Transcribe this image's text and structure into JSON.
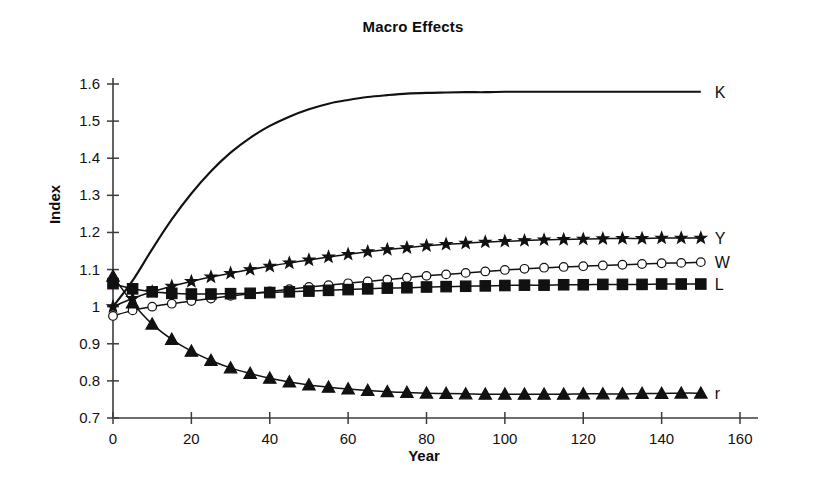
{
  "chart_data": {
    "type": "line",
    "title": "Macro Effects",
    "xlabel": "Year",
    "ylabel": "Index",
    "xlim": [
      0,
      160
    ],
    "ylim": [
      0.7,
      1.6
    ],
    "xticks": [
      0,
      20,
      40,
      60,
      80,
      100,
      120,
      140,
      160
    ],
    "xtick_labels": [
      "0",
      "20",
      "40",
      "60",
      "80",
      "100",
      "120",
      "140",
      "160"
    ],
    "yticks": [
      0.7,
      0.8,
      0.9,
      1.0,
      1.1,
      1.2,
      1.3,
      1.4,
      1.5,
      1.6
    ],
    "ytick_labels": [
      "0.7",
      "0.8",
      "0.9",
      "1",
      "1.1",
      "1.2",
      "1.3",
      "1.4",
      "1.5",
      "1.6"
    ],
    "grid": false,
    "legend_position": "right-of-curve-ends",
    "x": [
      0,
      5,
      10,
      15,
      20,
      25,
      30,
      35,
      40,
      45,
      50,
      55,
      60,
      65,
      70,
      75,
      80,
      85,
      90,
      95,
      100,
      105,
      110,
      115,
      120,
      125,
      130,
      135,
      140,
      145,
      150
    ],
    "series": [
      {
        "name": "K",
        "label": "K",
        "marker": "none",
        "line": "solid",
        "values": [
          1.0,
          1.07,
          1.155,
          1.235,
          1.305,
          1.365,
          1.415,
          1.455,
          1.487,
          1.512,
          1.532,
          1.547,
          1.557,
          1.565,
          1.57,
          1.574,
          1.576,
          1.577,
          1.578,
          1.578,
          1.579,
          1.579,
          1.579,
          1.579,
          1.579,
          1.579,
          1.579,
          1.579,
          1.579,
          1.579,
          1.579
        ]
      },
      {
        "name": "Y",
        "label": "Y",
        "marker": "star",
        "line": "solid",
        "values": [
          1.0,
          1.022,
          1.04,
          1.055,
          1.068,
          1.08,
          1.09,
          1.1,
          1.109,
          1.118,
          1.126,
          1.134,
          1.141,
          1.148,
          1.154,
          1.159,
          1.164,
          1.168,
          1.171,
          1.174,
          1.176,
          1.178,
          1.18,
          1.181,
          1.182,
          1.183,
          1.184,
          1.184,
          1.185,
          1.185,
          1.185
        ]
      },
      {
        "name": "W",
        "label": "W",
        "marker": "circle-open",
        "line": "solid",
        "values": [
          0.975,
          0.99,
          1.0,
          1.008,
          1.015,
          1.022,
          1.029,
          1.035,
          1.041,
          1.047,
          1.053,
          1.058,
          1.063,
          1.068,
          1.073,
          1.078,
          1.083,
          1.087,
          1.091,
          1.095,
          1.099,
          1.102,
          1.105,
          1.107,
          1.109,
          1.111,
          1.113,
          1.115,
          1.117,
          1.118,
          1.12
        ]
      },
      {
        "name": "L",
        "label": "L",
        "marker": "square-filled",
        "line": "solid",
        "values": [
          1.062,
          1.048,
          1.04,
          1.036,
          1.034,
          1.034,
          1.035,
          1.036,
          1.038,
          1.04,
          1.042,
          1.044,
          1.046,
          1.048,
          1.05,
          1.051,
          1.053,
          1.054,
          1.055,
          1.056,
          1.057,
          1.058,
          1.058,
          1.059,
          1.059,
          1.06,
          1.06,
          1.06,
          1.061,
          1.061,
          1.061
        ]
      },
      {
        "name": "r",
        "label": "r",
        "marker": "triangle-filled",
        "line": "solid",
        "values": [
          1.082,
          1.01,
          0.953,
          0.912,
          0.88,
          0.855,
          0.835,
          0.82,
          0.807,
          0.797,
          0.789,
          0.783,
          0.778,
          0.774,
          0.771,
          0.769,
          0.767,
          0.766,
          0.765,
          0.764,
          0.764,
          0.764,
          0.764,
          0.764,
          0.765,
          0.765,
          0.765,
          0.766,
          0.766,
          0.767,
          0.767
        ]
      }
    ]
  },
  "colors": {
    "background": "#ffffff",
    "ink": "#111111",
    "axis": "#3c3c3c"
  }
}
